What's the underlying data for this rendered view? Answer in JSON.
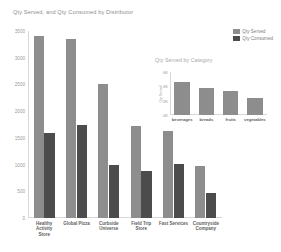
{
  "chart_data": [
    {
      "id": "main",
      "type": "bar",
      "title": "Qty Served, and Qty Consumed by Distributor",
      "xlabel": "",
      "ylabel": "",
      "ylim": [
        0,
        3500
      ],
      "yticks": [
        "0",
        "500",
        "1000",
        "1500",
        "2000",
        "2500",
        "3000",
        "3500"
      ],
      "ytick_values": [
        0,
        500,
        1000,
        1500,
        2000,
        2500,
        3000,
        3500
      ],
      "grid": false,
      "legend_position": "top-right",
      "categories": [
        "Healthy Activity Store",
        "Global Pizza",
        "Curbside Universe",
        "Field Trip Store",
        "Fast Services",
        "Countryside Company"
      ],
      "category_lines": [
        [
          "Healthy",
          "Activity",
          "Store"
        ],
        [
          "Global Pizza"
        ],
        [
          "Curbside",
          "Universe"
        ],
        [
          "Field Trip",
          "Store"
        ],
        [
          "Fast Services"
        ],
        [
          "Countryside",
          "Company"
        ]
      ],
      "series": [
        {
          "name": "Qty Served",
          "color": "#8d8d8d",
          "values": [
            3400,
            3350,
            2500,
            1730,
            1620,
            970
          ]
        },
        {
          "name": "Qty Consumed",
          "color": "#4c4c4c",
          "values": [
            1600,
            1750,
            1000,
            875,
            1010,
            460
          ]
        }
      ]
    },
    {
      "id": "inset",
      "type": "bar",
      "title": "Qty Served by Category",
      "xlabel": "",
      "ylabel": "Qty Served",
      "ylim": [
        0,
        6000
      ],
      "yticks": [
        "0K",
        "2K",
        "4K",
        "6K"
      ],
      "ytick_values": [
        0,
        2000,
        4000,
        6000
      ],
      "grid": false,
      "categories": [
        "beverages",
        "breads",
        "fruits",
        "vegetables"
      ],
      "series": [
        {
          "name": "Qty Served",
          "color": "#8d8d8d",
          "values": [
            4600,
            3800,
            3400,
            2400
          ]
        }
      ]
    }
  ],
  "main": {
    "title": "Qty Served, and Qty Consumed by Distributor"
  },
  "inset": {
    "title": "Qty Served by Category",
    "ylabel": "Qty Served"
  },
  "legend": {
    "items": [
      {
        "label": "Qty Served",
        "color": "#8d8d8d"
      },
      {
        "label": "Qty Consumed",
        "color": "#4c4c4c"
      }
    ]
  },
  "colors": {
    "served": "#8d8d8d",
    "consumed": "#4c4c4c",
    "axis": "#d8d8d8",
    "title": "#8d8d8d",
    "tick": "#9a9a9a",
    "background": "#ffffff"
  }
}
